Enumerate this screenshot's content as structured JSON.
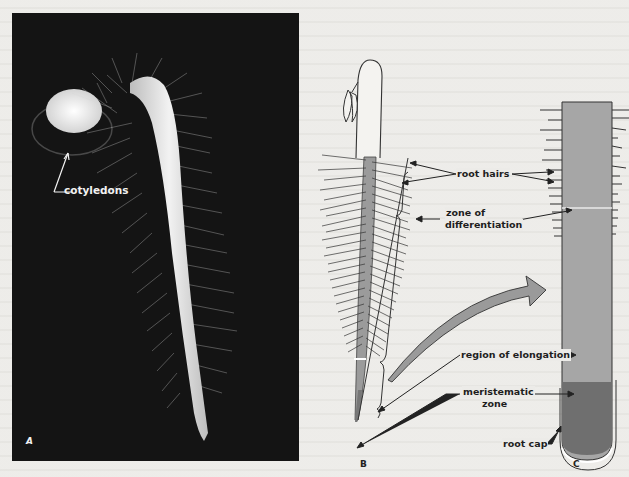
{
  "figure": {
    "panels": [
      {
        "id": "A",
        "label": "A",
        "kind": "photograph",
        "description": "seedling with root hairs on dark background"
      },
      {
        "id": "B",
        "label": "B",
        "kind": "drawing",
        "description": "seedling root with zones"
      },
      {
        "id": "C",
        "label": "C",
        "kind": "drawing",
        "description": "enlarged root tip section"
      }
    ],
    "labels": {
      "cotyledons": "cotyledons",
      "root_hairs": "root hairs",
      "zone_diff_1": "zone of",
      "zone_diff_2": "differentiation",
      "elongation": "region of elongation",
      "meristem_1": "meristematic",
      "meristem_2": "zone",
      "root_cap": "root cap"
    },
    "colors": {
      "photo_bg": "#141414",
      "root_fill": "#a9a9a9",
      "meristem_fill": "#6e6e6e",
      "paper": "#ecebe8"
    }
  }
}
